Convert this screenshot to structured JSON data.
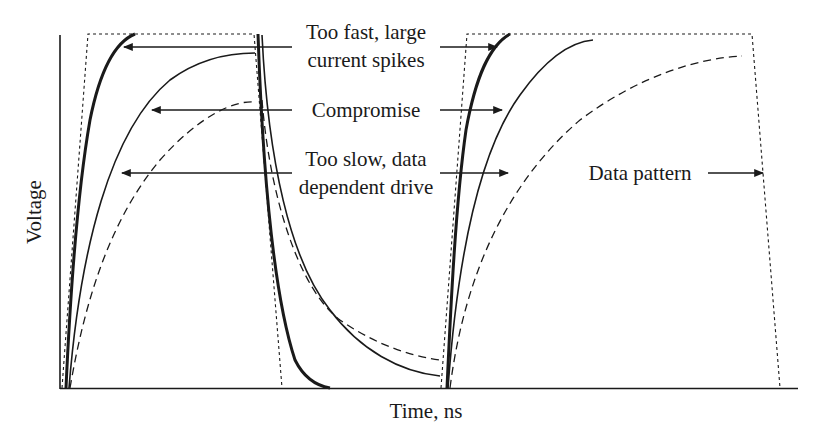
{
  "figure": {
    "xlabel": "Time, ns",
    "ylabel": "Voltage",
    "annotations": {
      "too_fast_line1": "Too fast, large",
      "too_fast_line2": "current spikes",
      "compromise": "Compromise",
      "too_slow_line1": "Too slow, data",
      "too_slow_line2": "dependent drive",
      "data_pattern": "Data pattern"
    },
    "colors": {
      "line": "#1a1a1a",
      "background": "#ffffff"
    }
  },
  "legend_curves": [
    {
      "name": "Too fast, large current spikes",
      "style": "thick solid"
    },
    {
      "name": "Compromise",
      "style": "thin solid"
    },
    {
      "name": "Too slow, data dependent drive",
      "style": "dashed"
    },
    {
      "name": "Data pattern",
      "style": "dotted"
    }
  ]
}
